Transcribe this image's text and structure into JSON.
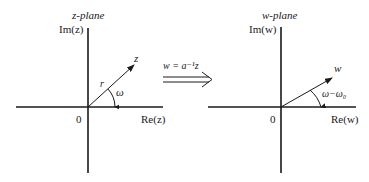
{
  "left_plane": {
    "title": "z-plane",
    "title_var": "z",
    "title_suffix": "-plane",
    "imag_axis_label": "Im(z)",
    "real_axis_label": "Re(z)",
    "origin_label": "0",
    "vector_label": "z",
    "magnitude_label": "r",
    "angle_label": "ω"
  },
  "transform": {
    "equation": "w = a⁻¹z",
    "arrow": "double-arrow-right"
  },
  "right_plane": {
    "title": "w-plane",
    "imag_axis_label": "Im(w)",
    "real_axis_label": "Re(w)",
    "origin_label": "0",
    "vector_label": "w",
    "angle_label": "ω−ω₀"
  },
  "colors": {
    "ink": "#1a1a1a",
    "background": "#ffffff"
  }
}
